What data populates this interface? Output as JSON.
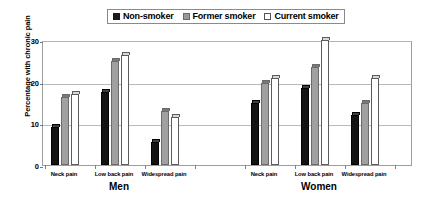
{
  "chart_data": {
    "type": "bar",
    "title": "",
    "xlabel": "",
    "ylabel": "Percentage with chronic pain",
    "ylim": [
      0,
      30
    ],
    "yticks": [
      0,
      10,
      20,
      30
    ],
    "grid": true,
    "legend_position": "top-center",
    "legend": [
      "Non-smoker",
      "Former smoker",
      "Current smoker"
    ],
    "group_labels": [
      "Men",
      "Women"
    ],
    "categories": [
      "Neck pain",
      "Low back pain",
      "Widespread pain",
      "Neck pain",
      "Low back pain",
      "Widespread pain"
    ],
    "series": [
      {
        "name": "Non-smoker",
        "values": [
          9.2,
          17.5,
          5.5,
          15.0,
          18.6,
          12.0
        ]
      },
      {
        "name": "Former smoker",
        "values": [
          16.4,
          25.0,
          13.0,
          19.6,
          23.6,
          15.0
        ]
      },
      {
        "name": "Current smoker",
        "values": [
          17.0,
          26.3,
          11.5,
          21.0,
          30.0,
          21.0
        ]
      }
    ]
  },
  "legend": {
    "items": [
      {
        "label": "Non-smoker",
        "swatch": "legend-swatch-black"
      },
      {
        "label": "Former smoker",
        "swatch": "legend-swatch-gray"
      },
      {
        "label": "Current smoker",
        "swatch": "legend-swatch-white"
      }
    ]
  },
  "axes": {
    "y_title": "Percentage with chronic pain",
    "y_ticks": [
      "0",
      "10",
      "20",
      "30"
    ]
  },
  "groups": [
    {
      "name": "Men",
      "categories": [
        {
          "label": "Neck pain",
          "values": [
            9.2,
            16.4,
            17.0
          ]
        },
        {
          "label": "Low back pain",
          "values": [
            17.5,
            25.0,
            26.3
          ]
        },
        {
          "label": "Widespread pain",
          "values": [
            5.5,
            13.0,
            11.5
          ]
        }
      ]
    },
    {
      "name": "Women",
      "categories": [
        {
          "label": "Neck pain",
          "values": [
            15.0,
            19.6,
            21.0
          ]
        },
        {
          "label": "Low back pain",
          "values": [
            18.6,
            23.6,
            30.0
          ]
        },
        {
          "label": "Widespread pain",
          "values": [
            12.0,
            15.0,
            21.0
          ]
        }
      ]
    }
  ],
  "colors": {
    "non_smoker": "#131313",
    "former_smoker": "#a0a0a0",
    "current_smoker": "#ffffff",
    "grid": "#b9b9b9",
    "frame": "#9d9d9d",
    "background": "#ffffff"
  }
}
